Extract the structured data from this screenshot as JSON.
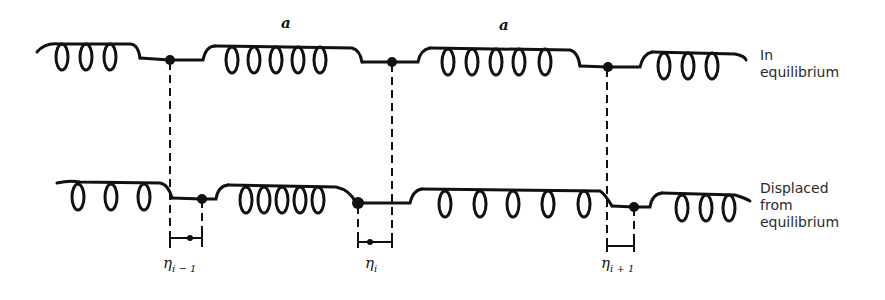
{
  "diagram": {
    "title": "",
    "rows": [
      {
        "id": "equilibrium",
        "label_lines": [
          "In",
          "equilibrium"
        ],
        "nodes_x": [
          170,
          392,
          608
        ]
      },
      {
        "id": "displaced",
        "label_lines": [
          "Displaced",
          "from",
          "equilibrium"
        ],
        "nodes_x": [
          202,
          358,
          634
        ]
      }
    ],
    "spacing_labels": [
      "a",
      "a"
    ],
    "displacements": [
      {
        "symbol": "η",
        "subscript": "i − 1"
      },
      {
        "symbol": "η",
        "subscript": "i"
      },
      {
        "symbol": "η",
        "subscript": "i + 1"
      }
    ],
    "colors": {
      "ink": "#111111",
      "background": "#ffffff"
    }
  }
}
